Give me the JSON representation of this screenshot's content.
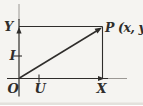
{
  "figure": {
    "colors": {
      "paper": "#f5f4f1",
      "ink": "#2f2d2b",
      "ink_faded": "#9b9894",
      "edge_shadow": "#dedcd7"
    },
    "labels": {
      "y_axis": "Y",
      "x_axis": "X",
      "origin": "O",
      "y_unit": "I",
      "x_unit": "U",
      "point": "P (x, y)"
    }
  }
}
